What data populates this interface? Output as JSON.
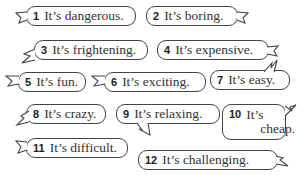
{
  "bubbles": [
    {
      "num": "1",
      "text": "It’s dangerous."
    },
    {
      "num": "2",
      "text": "It’s boring."
    },
    {
      "num": "3",
      "text": "It’s frightening."
    },
    {
      "num": "4",
      "text": "It’s expensive."
    },
    {
      "num": "5",
      "text": "It’s fun."
    },
    {
      "num": "6",
      "text": "It’s exciting."
    },
    {
      "num": "7",
      "text": "It’s easy."
    },
    {
      "num": "8",
      "text": "It’s crazy."
    },
    {
      "num": "9",
      "text": "It’s relaxing."
    },
    {
      "num": "10",
      "text_line1": "It’s",
      "text_line2": "cheap."
    },
    {
      "num": "11",
      "text": "It’s difficult."
    },
    {
      "num": "12",
      "text": "It’s challenging."
    }
  ]
}
